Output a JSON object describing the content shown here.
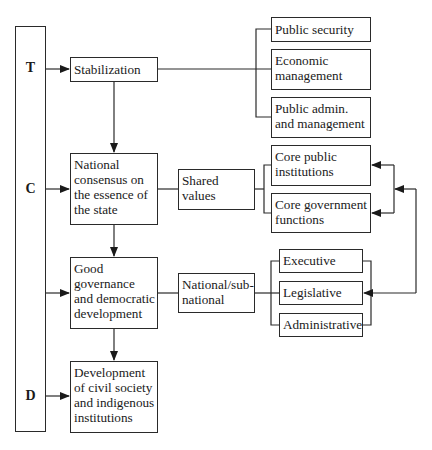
{
  "diagram": {
    "phases": [
      {
        "label": "T",
        "y": 66
      },
      {
        "label": "C",
        "y": 188
      },
      {
        "label": "D",
        "y": 395
      }
    ],
    "main_column": {
      "stabilization": "Stabilization",
      "national_consensus": "National consensus on the essence of the state",
      "good_governance": "Good governance and democratic development",
      "civil_society": "Development of civil society and indigenous institutions"
    },
    "middle_column": {
      "shared_values": "Shared values",
      "national_subnational": "National/sub-national"
    },
    "right_column": {
      "stabilization_group": [
        "Public security",
        "Economic management",
        "Public admin. and management"
      ],
      "core_group": [
        "Core public institutions",
        "Core government functions"
      ],
      "branches_group": [
        "Executive",
        "Legislative",
        "Administrative"
      ]
    },
    "colors": {
      "line": "#2a2a2a",
      "background": "#ffffff"
    }
  }
}
